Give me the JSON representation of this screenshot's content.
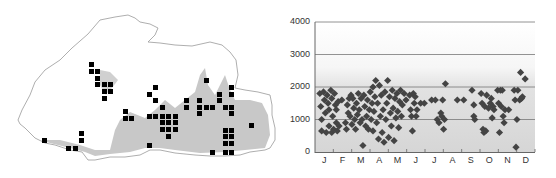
{
  "map": {
    "title": "Distribution map (grid records)",
    "border_color": "#888888",
    "range_fill_color": "#c8c8c8",
    "record_color": "#000000",
    "records": [
      [
        89,
        62
      ],
      [
        89,
        69
      ],
      [
        95,
        69
      ],
      [
        95,
        76
      ],
      [
        95,
        82
      ],
      [
        102,
        82
      ],
      [
        108,
        82
      ],
      [
        102,
        89
      ],
      [
        108,
        89
      ],
      [
        102,
        96
      ],
      [
        123,
        109
      ],
      [
        123,
        116
      ],
      [
        129,
        116
      ],
      [
        42,
        138
      ],
      [
        79,
        131
      ],
      [
        79,
        138
      ],
      [
        66,
        146
      ],
      [
        73,
        146
      ],
      [
        153,
        85
      ],
      [
        147,
        92
      ],
      [
        153,
        98
      ],
      [
        160,
        105
      ],
      [
        147,
        114
      ],
      [
        153,
        114
      ],
      [
        160,
        114
      ],
      [
        166,
        114
      ],
      [
        173,
        114
      ],
      [
        160,
        120
      ],
      [
        166,
        120
      ],
      [
        173,
        120
      ],
      [
        160,
        127
      ],
      [
        166,
        127
      ],
      [
        173,
        127
      ],
      [
        166,
        134
      ],
      [
        147,
        143
      ],
      [
        204,
        78
      ],
      [
        184,
        98
      ],
      [
        184,
        105
      ],
      [
        197,
        98
      ],
      [
        197,
        105
      ],
      [
        204,
        105
      ],
      [
        210,
        105
      ],
      [
        197,
        111
      ],
      [
        217,
        92
      ],
      [
        217,
        98
      ],
      [
        229,
        85
      ],
      [
        229,
        92
      ],
      [
        223,
        105
      ],
      [
        229,
        105
      ],
      [
        229,
        111
      ],
      [
        223,
        128
      ],
      [
        229,
        128
      ],
      [
        223,
        134
      ],
      [
        229,
        134
      ],
      [
        223,
        141
      ],
      [
        229,
        141
      ],
      [
        223,
        150
      ],
      [
        229,
        150
      ],
      [
        210,
        150
      ],
      [
        249,
        123
      ]
    ]
  },
  "chart_data": {
    "type": "scatter",
    "title": "",
    "xlabel": "",
    "ylabel": "",
    "ylim": [
      0,
      4000
    ],
    "yticks": [
      0,
      1000,
      2000,
      3000,
      4000
    ],
    "ytick_labels": [
      "0",
      "1000",
      "2000",
      "3000",
      "4000"
    ],
    "categories": [
      "J",
      "F",
      "M",
      "A",
      "M",
      "J",
      "J",
      "A",
      "S",
      "O",
      "N",
      "D"
    ],
    "grid": true,
    "marker": "diamond",
    "marker_color": "#444444",
    "background": "gradient: white above ~3000 m fading to light gray below 2000 m",
    "points": [
      [
        0.1,
        1800
      ],
      [
        0.15,
        1400
      ],
      [
        0.2,
        1000
      ],
      [
        0.2,
        650
      ],
      [
        0.3,
        1850
      ],
      [
        0.35,
        1600
      ],
      [
        0.4,
        1200
      ],
      [
        0.45,
        600
      ],
      [
        0.5,
        1750
      ],
      [
        0.55,
        1500
      ],
      [
        0.6,
        1300
      ],
      [
        0.6,
        800
      ],
      [
        0.7,
        1900
      ],
      [
        0.75,
        1650
      ],
      [
        0.75,
        600
      ],
      [
        0.8,
        1100
      ],
      [
        0.85,
        700
      ],
      [
        0.9,
        1800
      ],
      [
        0.95,
        1450
      ],
      [
        1.0,
        1300
      ],
      [
        1.0,
        900
      ],
      [
        1.05,
        650
      ],
      [
        1.1,
        1550
      ],
      [
        1.15,
        800
      ],
      [
        1.3,
        1600
      ],
      [
        1.5,
        900
      ],
      [
        1.55,
        700
      ],
      [
        1.6,
        1450
      ],
      [
        1.65,
        1200
      ],
      [
        1.7,
        1650
      ],
      [
        1.75,
        1100
      ],
      [
        1.8,
        1750
      ],
      [
        1.85,
        850
      ],
      [
        1.9,
        1650
      ],
      [
        1.95,
        1350
      ],
      [
        2.0,
        1000
      ],
      [
        2.05,
        700
      ],
      [
        2.1,
        1500
      ],
      [
        2.15,
        1150
      ],
      [
        2.2,
        1800
      ],
      [
        2.25,
        1300
      ],
      [
        2.3,
        900
      ],
      [
        2.35,
        1650
      ],
      [
        2.4,
        1000
      ],
      [
        2.45,
        200
      ],
      [
        2.5,
        1750
      ],
      [
        2.55,
        1400
      ],
      [
        2.6,
        800
      ],
      [
        2.65,
        1100
      ],
      [
        2.7,
        1600
      ],
      [
        2.75,
        700
      ],
      [
        2.8,
        1300
      ],
      [
        2.85,
        1850
      ],
      [
        2.9,
        1000
      ],
      [
        2.95,
        1500
      ],
      [
        3.0,
        650
      ],
      [
        3.0,
        2000
      ],
      [
        3.05,
        1250
      ],
      [
        3.1,
        1700
      ],
      [
        3.15,
        2200
      ],
      [
        3.2,
        900
      ],
      [
        3.25,
        1500
      ],
      [
        3.3,
        400
      ],
      [
        3.35,
        2050
      ],
      [
        3.4,
        1100
      ],
      [
        3.45,
        1750
      ],
      [
        3.5,
        600
      ],
      [
        3.55,
        1300
      ],
      [
        3.6,
        300
      ],
      [
        3.65,
        1850
      ],
      [
        3.7,
        1000
      ],
      [
        3.75,
        1500
      ],
      [
        3.8,
        2200
      ],
      [
        3.85,
        450
      ],
      [
        3.9,
        1700
      ],
      [
        3.95,
        1200
      ],
      [
        4.0,
        800
      ],
      [
        4.05,
        1900
      ],
      [
        4.1,
        1350
      ],
      [
        4.15,
        350
      ],
      [
        4.2,
        1650
      ],
      [
        4.25,
        1050
      ],
      [
        4.3,
        1800
      ],
      [
        4.35,
        1250
      ],
      [
        4.4,
        750
      ],
      [
        4.45,
        1550
      ],
      [
        4.5,
        1900
      ],
      [
        4.55,
        1100
      ],
      [
        4.6,
        1450
      ],
      [
        4.7,
        1800
      ],
      [
        4.8,
        1600
      ],
      [
        5.0,
        1750
      ],
      [
        5.05,
        1300
      ],
      [
        5.1,
        1100
      ],
      [
        5.15,
        650
      ],
      [
        5.2,
        1800
      ],
      [
        5.25,
        1500
      ],
      [
        5.3,
        1700
      ],
      [
        5.35,
        1100
      ],
      [
        5.4,
        1300
      ],
      [
        5.6,
        1500
      ],
      [
        5.8,
        1500
      ],
      [
        6.2,
        1600
      ],
      [
        6.4,
        1600
      ],
      [
        6.5,
        1000
      ],
      [
        6.6,
        900
      ],
      [
        6.7,
        1200
      ],
      [
        6.75,
        1100
      ],
      [
        6.8,
        1600
      ],
      [
        6.85,
        700
      ],
      [
        6.9,
        1000
      ],
      [
        6.95,
        2100
      ],
      [
        7.6,
        1600
      ],
      [
        7.95,
        1600
      ],
      [
        8.4,
        1900
      ],
      [
        8.5,
        1450
      ],
      [
        8.5,
        1100
      ],
      [
        8.55,
        1000
      ],
      [
        8.9,
        1800
      ],
      [
        8.95,
        1500
      ],
      [
        9.0,
        700
      ],
      [
        9.05,
        600
      ],
      [
        9.1,
        1400
      ],
      [
        9.15,
        650
      ],
      [
        9.2,
        1750
      ],
      [
        9.3,
        1350
      ],
      [
        9.4,
        1500
      ],
      [
        9.45,
        1650
      ],
      [
        9.5,
        1050
      ],
      [
        9.55,
        1400
      ],
      [
        9.6,
        1300
      ],
      [
        9.8,
        1900
      ],
      [
        9.85,
        1500
      ],
      [
        9.9,
        600
      ],
      [
        9.95,
        1900
      ],
      [
        10.0,
        1400
      ],
      [
        10.05,
        1900
      ],
      [
        10.1,
        1100
      ],
      [
        10.15,
        900
      ],
      [
        10.2,
        1300
      ],
      [
        10.4,
        1300
      ],
      [
        10.7,
        1900
      ],
      [
        10.75,
        1600
      ],
      [
        10.8,
        150
      ],
      [
        10.85,
        1000
      ],
      [
        10.9,
        1900
      ],
      [
        11.0,
        1600
      ],
      [
        11.05,
        2450
      ],
      [
        11.1,
        1650
      ],
      [
        11.15,
        1700
      ],
      [
        11.3,
        2250
      ]
    ]
  }
}
